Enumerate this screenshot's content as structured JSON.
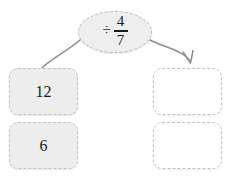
{
  "diagram": {
    "type": "function-machine",
    "operation": {
      "label": "÷ 4/7",
      "sign": "÷",
      "numerator": "4",
      "denominator": "7"
    },
    "input_boxes": [
      {
        "value": "12",
        "state": "filled"
      },
      {
        "value": "6",
        "state": "filled"
      }
    ],
    "output_boxes": [
      {
        "value": "",
        "state": "empty"
      },
      {
        "value": "",
        "state": "empty"
      }
    ],
    "connectors": [
      {
        "name": "left-curve",
        "arrowhead": false
      },
      {
        "name": "right-arrow",
        "arrowhead": true
      }
    ],
    "colors": {
      "filled_box_fill": "#ededed",
      "empty_box_fill": "#ffffff",
      "border_dash": "#c2c2c2",
      "ellipse_fill": "#eeeeee",
      "connector": "#8d8d8d",
      "text": "#1b1b1b"
    }
  }
}
